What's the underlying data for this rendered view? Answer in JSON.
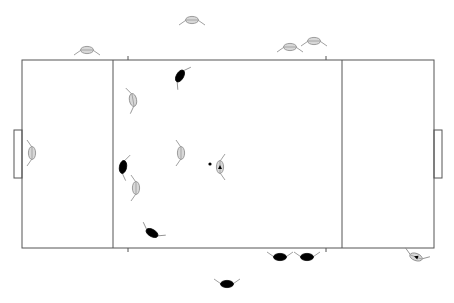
{
  "diagram": {
    "type": "top-down court tactical board",
    "colors": {
      "line": "#555555",
      "team_light_fill": "#d8d8d8",
      "team_light_stroke": "#888888",
      "team_dark_fill": "#000000",
      "arm": "#888888",
      "ball": "#000000"
    },
    "court": {
      "x": 22,
      "y": 60,
      "w": 412,
      "h": 188
    },
    "zone_lines": [
      113,
      342
    ],
    "goals": [
      {
        "side": "left",
        "x": 14,
        "y": 130,
        "w": 8,
        "h": 48
      },
      {
        "side": "right",
        "x": 434,
        "y": 130,
        "w": 8,
        "h": 48
      }
    ],
    "ticks": [
      {
        "x": 128,
        "y": 56,
        "len": 4
      },
      {
        "x": 326,
        "y": 56,
        "len": 4
      },
      {
        "x": 128,
        "y": 248,
        "len": 4
      },
      {
        "x": 326,
        "y": 248,
        "len": 4
      }
    ],
    "ball": {
      "x": 210,
      "y": 164,
      "r": 1.6
    },
    "players": [
      {
        "id": "light-bench-1",
        "team": "light",
        "x": 192,
        "y": 20,
        "rot": 0
      },
      {
        "id": "light-bench-2",
        "team": "light",
        "x": 87,
        "y": 50,
        "rot": 0
      },
      {
        "id": "light-bench-3",
        "team": "light",
        "x": 290,
        "y": 47,
        "rot": 0
      },
      {
        "id": "light-bench-4",
        "team": "light",
        "x": 314,
        "y": 41,
        "rot": 0
      },
      {
        "id": "light-keeper",
        "team": "light",
        "x": 32,
        "y": 153,
        "rot": 90
      },
      {
        "id": "light-field-1",
        "team": "light",
        "x": 133,
        "y": 100,
        "rot": 80
      },
      {
        "id": "light-field-2",
        "team": "light",
        "x": 181,
        "y": 153,
        "rot": 90
      },
      {
        "id": "light-field-3",
        "team": "light",
        "x": 136,
        "y": 188,
        "rot": 90
      },
      {
        "id": "light-field-4",
        "team": "light",
        "x": 220,
        "y": 167,
        "rot": -90,
        "marked": true
      },
      {
        "id": "dark-field-1",
        "team": "dark",
        "x": 180,
        "y": 76,
        "rot": -60
      },
      {
        "id": "dark-field-2",
        "team": "dark",
        "x": 123,
        "y": 167,
        "rot": -80
      },
      {
        "id": "dark-field-3",
        "team": "dark",
        "x": 152,
        "y": 233,
        "rot": -150
      },
      {
        "id": "dark-bench-1",
        "team": "dark",
        "x": 280,
        "y": 257,
        "rot": 180
      },
      {
        "id": "dark-bench-2",
        "team": "dark",
        "x": 307,
        "y": 257,
        "rot": 180
      },
      {
        "id": "dark-bench-3",
        "team": "dark",
        "x": 227,
        "y": 284,
        "rot": 180
      },
      {
        "id": "light-bench-5",
        "team": "light",
        "x": 416,
        "y": 257,
        "rot": 200,
        "marked": true
      }
    ]
  }
}
